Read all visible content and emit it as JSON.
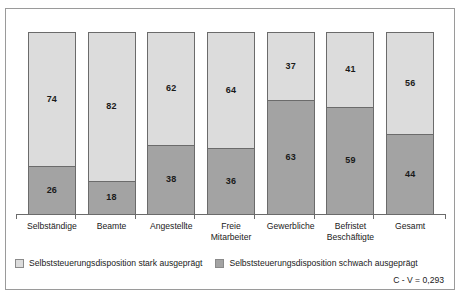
{
  "chart_data": {
    "type": "bar",
    "subtype": "stacked-100-percent",
    "title": "",
    "xlabel": "",
    "ylabel": "",
    "ylim": [
      0,
      100
    ],
    "grid": false,
    "legend_position": "bottom",
    "categories": [
      "Selbständige",
      "Beamte",
      "Angestellte",
      "Freie\nMitarbeiter",
      "Gewerbliche",
      "Befristet\nBeschäftigte",
      "Gesamt"
    ],
    "category_lines": [
      [
        "Selbständige"
      ],
      [
        "Beamte"
      ],
      [
        "Angestellte"
      ],
      [
        "Freie",
        "Mitarbeiter"
      ],
      [
        "Gewerbliche"
      ],
      [
        "Befristet",
        "Beschäftigte"
      ],
      [
        "Gesamt"
      ]
    ],
    "series": [
      {
        "name": "Selbststeuerungsdisposition stark ausgeprägt",
        "color": "#dcdcdc",
        "values": [
          74,
          82,
          62,
          64,
          37,
          41,
          56
        ]
      },
      {
        "name": "Selbststeuerungsdisposition schwach ausgeprägt",
        "color": "#a3a3a3",
        "values": [
          26,
          18,
          38,
          36,
          63,
          59,
          44
        ]
      }
    ],
    "annotations": [
      "C - V = 0,293"
    ]
  },
  "legend": {
    "items": [
      {
        "label": "Selbststeuerungsdisposition stark ausgeprägt",
        "swatch": "legend-swatch-strong"
      },
      {
        "label": "Selbststeuerungsdisposition schwach ausgeprägt",
        "swatch": "legend-swatch-weak"
      }
    ]
  },
  "footnote": {
    "text": "C - V = 0,293"
  },
  "colors": {
    "strong": "#dcdcdc",
    "weak": "#a3a3a3",
    "bar_border": "#6b6b6b",
    "frame_border": "#9a9a9a",
    "text": "#1a1a1a",
    "background": "#ffffff"
  }
}
